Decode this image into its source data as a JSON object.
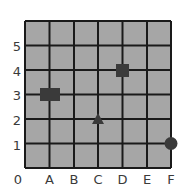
{
  "grid": {
    "columns": 6,
    "rows": 6,
    "cell_color": "#a6a6a6",
    "line_color": "#1a1a1a",
    "origin_label": "0",
    "x_labels": [
      "A",
      "B",
      "C",
      "D",
      "E",
      "F"
    ],
    "y_labels": [
      "1",
      "2",
      "3",
      "4",
      "5"
    ]
  },
  "markers": [
    {
      "shape": "rectangle",
      "position": "A3",
      "x": "A",
      "y": 3,
      "color": "#3a3a3a"
    },
    {
      "shape": "square",
      "position": "D4",
      "x": "D",
      "y": 4,
      "color": "#3a3a3a"
    },
    {
      "shape": "triangle",
      "position": "C2",
      "x": "C",
      "y": 2,
      "color": "#3a3a3a"
    },
    {
      "shape": "circle",
      "position": "F1",
      "x": "F",
      "y": 1,
      "color": "#3a3a3a"
    }
  ]
}
